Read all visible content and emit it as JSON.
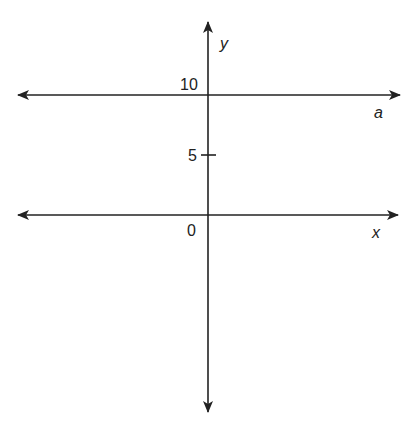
{
  "diagram": {
    "type": "coordinate-plane",
    "axes": {
      "x_label": "x",
      "y_label": "y"
    },
    "ticks": [
      {
        "value": 10,
        "label": "10"
      },
      {
        "value": 5,
        "label": "5"
      },
      {
        "value": 0,
        "label": "0"
      }
    ],
    "lines": [
      {
        "name": "a",
        "label": "a",
        "equation": "y = 10"
      }
    ],
    "colors": {
      "stroke": "#222222",
      "background": "#ffffff"
    }
  }
}
